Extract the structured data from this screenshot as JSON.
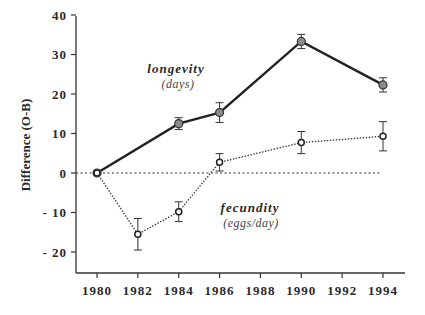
{
  "chart_data": {
    "type": "line",
    "title": "",
    "xlabel": "",
    "ylabel": "Difference (O-B)",
    "x": [
      1980,
      1984,
      1986,
      1990,
      1994
    ],
    "x_ticks": [
      "1980",
      "1982",
      "1984",
      "1986",
      "1988",
      "1990",
      "1992",
      "1994"
    ],
    "y_ticks": [
      "40",
      "30",
      "20",
      "10",
      "0",
      "-10",
      "-20"
    ],
    "xlim": [
      1979,
      1995
    ],
    "ylim": [
      -25,
      40
    ],
    "grid": false,
    "reference_line": {
      "y": 0,
      "style": "dotted"
    },
    "series": [
      {
        "name": "longevity",
        "unit": "(days)",
        "style": "solid",
        "marker": "filled-gray-circle",
        "x": [
          1980,
          1984,
          1986,
          1990,
          1994
        ],
        "values": [
          0,
          12.5,
          15.3,
          33.3,
          22.3
        ],
        "error": [
          0,
          1.5,
          2.5,
          1.8,
          1.8
        ]
      },
      {
        "name": "fecundity",
        "unit": "(eggs/day)",
        "style": "dotted",
        "marker": "open-circle",
        "x": [
          1980,
          1982,
          1984,
          1986,
          1990,
          1994
        ],
        "values": [
          0,
          -15.5,
          -9.8,
          2.7,
          7.7,
          9.3
        ],
        "error": [
          0,
          4,
          2.5,
          2.2,
          2.8,
          3.7
        ]
      }
    ],
    "annotations": [
      {
        "text": "longevity",
        "sub": "(days)"
      },
      {
        "text": "fecundity",
        "sub": "(eggs/day)"
      }
    ]
  },
  "labels": {
    "ylabel": "Difference (O-B)",
    "long_main": "longevity",
    "long_sub": "(days)",
    "fec_main": "fecundity",
    "fec_sub": "(eggs/day)",
    "xt": [
      "1980",
      "1982",
      "1984",
      "1986",
      "1988",
      "1990",
      "1992",
      "1994"
    ],
    "yt": [
      "40",
      "30",
      "20",
      "10",
      "0",
      "-10",
      "-20"
    ]
  }
}
